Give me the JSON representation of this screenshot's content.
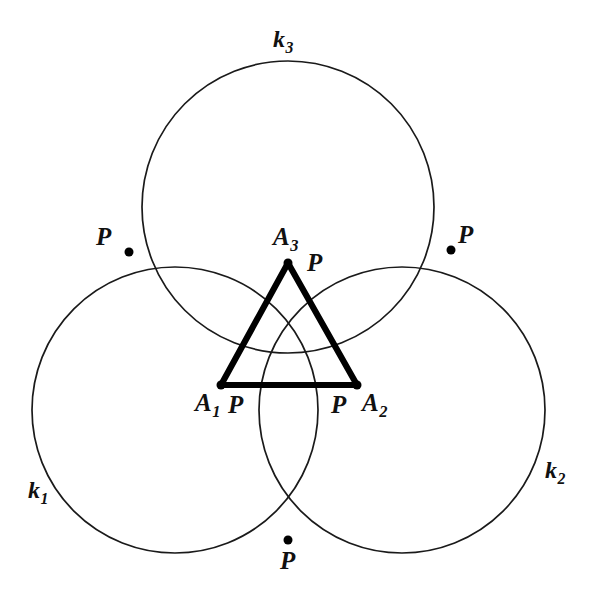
{
  "figure": {
    "background_color": "#ffffff",
    "stroke_color": "#1a1a1a",
    "triangle_color": "#000000"
  },
  "circles": [
    {
      "id": "k1",
      "label": "k",
      "subscript": "1",
      "center": {
        "x": 175,
        "y": 410
      },
      "radius": 143,
      "label_pos": {
        "x": 28,
        "y": 478
      }
    },
    {
      "id": "k2",
      "label": "k",
      "subscript": "2",
      "center": {
        "x": 402,
        "y": 410
      },
      "radius": 143,
      "label_pos": {
        "x": 545,
        "y": 458
      }
    },
    {
      "id": "k3",
      "label": "k",
      "subscript": "3",
      "center": {
        "x": 288,
        "y": 207
      },
      "radius": 146,
      "label_pos": {
        "x": 273,
        "y": 27
      }
    }
  ],
  "triangle": {
    "name": "A1A2A3",
    "vertices": [
      {
        "id": "A1",
        "label": "A",
        "subscript": "1",
        "point": {
          "x": 221,
          "y": 385
        },
        "label_pos": {
          "x": 195,
          "y": 390
        }
      },
      {
        "id": "A2",
        "label": "A",
        "subscript": "2",
        "point": {
          "x": 357,
          "y": 385
        },
        "label_pos": {
          "x": 362,
          "y": 390
        }
      },
      {
        "id": "A3",
        "label": "A",
        "subscript": "3",
        "point": {
          "x": 288,
          "y": 263
        },
        "label_pos": {
          "x": 273,
          "y": 224
        }
      }
    ],
    "sides": [
      {
        "from": "A1",
        "to": "A2"
      },
      {
        "from": "A2",
        "to": "A3"
      },
      {
        "from": "A3",
        "to": "A1"
      }
    ]
  },
  "intersection_points": [
    {
      "id": "P-left-outer",
      "label": "P",
      "point": {
        "x": 129,
        "y": 252
      },
      "label_pos": {
        "x": 96,
        "y": 224
      }
    },
    {
      "id": "P-right-outer",
      "label": "P",
      "point": {
        "x": 451,
        "y": 250
      },
      "label_pos": {
        "x": 458,
        "y": 222
      }
    },
    {
      "id": "P-bottom-outer",
      "label": "P",
      "point": {
        "x": 288,
        "y": 540
      },
      "label_pos": {
        "x": 280,
        "y": 548
      }
    },
    {
      "id": "P-at-A3",
      "label": "P",
      "point": {
        "x": 288,
        "y": 263
      },
      "label_pos": {
        "x": 307,
        "y": 250
      }
    },
    {
      "id": "P-at-A1",
      "label": "P",
      "point": {
        "x": 221,
        "y": 385
      },
      "label_pos": {
        "x": 228,
        "y": 392
      }
    },
    {
      "id": "P-at-A2",
      "label": "P",
      "point": {
        "x": 357,
        "y": 385
      },
      "label_pos": {
        "x": 331,
        "y": 392
      }
    }
  ],
  "geometry_notes": {
    "dot_radius": 4.5,
    "circle_stroke_width": 1.7,
    "triangle_stroke_width": 6.2
  }
}
